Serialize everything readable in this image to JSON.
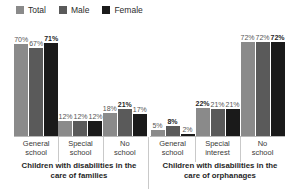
{
  "legend": {
    "position": "top-left",
    "items": [
      {
        "label": "Total",
        "color": "#8a8a8a",
        "icon": "square-swatch-icon"
      },
      {
        "label": "Male",
        "color": "#5a5a5a",
        "icon": "square-swatch-icon"
      },
      {
        "label": "Female",
        "color": "#1a1a1a",
        "icon": "square-swatch-icon"
      }
    ]
  },
  "captions": [
    {
      "line1": "Children with disabilities in the",
      "line2": "care of families"
    },
    {
      "line1": "Children with disabilities in the",
      "line2": "care of orphanages"
    }
  ],
  "sections": [
    {
      "name": "families",
      "groups": [
        {
          "line1": "General",
          "line2": "school",
          "bars": [
            {
              "series": "Total",
              "value": 70,
              "label": "70%",
              "emph": false
            },
            {
              "series": "Male",
              "value": 67,
              "label": "67%",
              "emph": false
            },
            {
              "series": "Female",
              "value": 71,
              "label": "71%",
              "emph": true
            }
          ]
        },
        {
          "line1": "Special",
          "line2": "school",
          "bars": [
            {
              "series": "Total",
              "value": 12,
              "label": "12%",
              "emph": false
            },
            {
              "series": "Male",
              "value": 12,
              "label": "12%",
              "emph": false
            },
            {
              "series": "Female",
              "value": 12,
              "label": "12%",
              "emph": false
            }
          ]
        },
        {
          "line1": "No",
          "line2": "school",
          "bars": [
            {
              "series": "Total",
              "value": 18,
              "label": "18%",
              "emph": false
            },
            {
              "series": "Male",
              "value": 21,
              "label": "21%",
              "emph": true
            },
            {
              "series": "Female",
              "value": 17,
              "label": "17%",
              "emph": false
            }
          ]
        }
      ]
    },
    {
      "name": "orphanages",
      "groups": [
        {
          "line1": "General",
          "line2": "school",
          "bars": [
            {
              "series": "Total",
              "value": 5,
              "label": "5%",
              "emph": false
            },
            {
              "series": "Male",
              "value": 8,
              "label": "8%",
              "emph": true
            },
            {
              "series": "Female",
              "value": 2,
              "label": "2%",
              "emph": false
            }
          ]
        },
        {
          "line1": "Special",
          "line2": "interest",
          "bars": [
            {
              "series": "Total",
              "value": 22,
              "label": "22%",
              "emph": true
            },
            {
              "series": "Male",
              "value": 21,
              "label": "21%",
              "emph": false
            },
            {
              "series": "Female",
              "value": 21,
              "label": "21%",
              "emph": false
            }
          ]
        },
        {
          "line1": "No",
          "line2": "school",
          "bars": [
            {
              "series": "Total",
              "value": 72,
              "label": "72%",
              "emph": false
            },
            {
              "series": "Male",
              "value": 72,
              "label": "72%",
              "emph": false
            },
            {
              "series": "Female",
              "value": 72,
              "label": "72%",
              "emph": true
            }
          ]
        }
      ]
    }
  ],
  "chart_data": {
    "type": "bar",
    "title": "",
    "subtitle": "",
    "xlabel": "",
    "ylabel": "",
    "ylim": [
      0,
      80
    ],
    "grid": false,
    "legend_position": "top-left",
    "legend": [
      "Total",
      "Male",
      "Female"
    ],
    "panels": [
      {
        "panel_label": "Children with disabilities in the care of families",
        "categories": [
          "General school",
          "Special school",
          "No school"
        ],
        "series": [
          {
            "name": "Total",
            "values": [
              70,
              12,
              18
            ],
            "color": "#8a8a8a"
          },
          {
            "name": "Male",
            "values": [
              67,
              12,
              21
            ],
            "color": "#5a5a5a"
          },
          {
            "name": "Female",
            "values": [
              71,
              12,
              17
            ],
            "color": "#1a1a1a"
          }
        ]
      },
      {
        "panel_label": "Children with disabilities in the care of orphanages",
        "categories": [
          "General school",
          "Special interest",
          "No school"
        ],
        "series": [
          {
            "name": "Total",
            "values": [
              5,
              22,
              72
            ],
            "color": "#8a8a8a"
          },
          {
            "name": "Male",
            "values": [
              8,
              21,
              72
            ],
            "color": "#5a5a5a"
          },
          {
            "name": "Female",
            "values": [
              2,
              21,
              72
            ],
            "color": "#1a1a1a"
          }
        ]
      }
    ],
    "value_labels_unit": "%"
  }
}
